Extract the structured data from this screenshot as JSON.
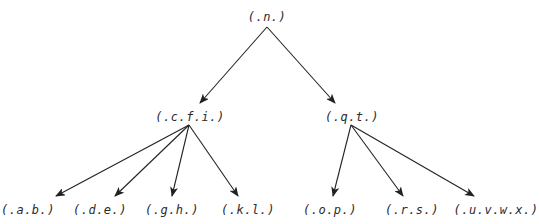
{
  "diagram": {
    "type": "tree",
    "colors": {
      "edge": "#222222",
      "text": "#2a2a2a",
      "background": "#ffffff"
    },
    "nodes": [
      {
        "id": "n",
        "label": "(.n.)",
        "x": 267,
        "y": 17,
        "ax": 267,
        "ay": 27,
        "tx": 267,
        "ty": 10
      },
      {
        "id": "cfi",
        "label": "(.c.f.i.)",
        "x": 190,
        "y": 117,
        "ax": 189,
        "ay": 125,
        "tx": 200,
        "ty": 103
      },
      {
        "id": "qt",
        "label": "(.q.t.)",
        "x": 352,
        "y": 117,
        "ax": 351,
        "ay": 125,
        "tx": 335,
        "ty": 103
      },
      {
        "id": "ab",
        "label": "(.a.b.)",
        "x": 28,
        "y": 210,
        "tx": 56,
        "ty": 196
      },
      {
        "id": "de",
        "label": "(.d.e.)",
        "x": 100,
        "y": 210,
        "tx": 115,
        "ty": 196
      },
      {
        "id": "gh",
        "label": "(.g.h.)",
        "x": 172,
        "y": 210,
        "tx": 172,
        "ty": 196
      },
      {
        "id": "kl",
        "label": "(.k.l.)",
        "x": 248,
        "y": 210,
        "tx": 238,
        "ty": 196
      },
      {
        "id": "op",
        "label": "(.o.p.)",
        "x": 330,
        "y": 210,
        "tx": 333,
        "ty": 196
      },
      {
        "id": "rs",
        "label": "(.r.s.)",
        "x": 412,
        "y": 210,
        "tx": 403,
        "ty": 196
      },
      {
        "id": "uvwx",
        "label": "(.u.v.w.x.)",
        "x": 496,
        "y": 210,
        "tx": 474,
        "ty": 196
      }
    ],
    "edges": [
      {
        "from": "n",
        "to": "cfi"
      },
      {
        "from": "n",
        "to": "qt"
      },
      {
        "from": "cfi",
        "to": "ab"
      },
      {
        "from": "cfi",
        "to": "de"
      },
      {
        "from": "cfi",
        "to": "gh"
      },
      {
        "from": "cfi",
        "to": "kl"
      },
      {
        "from": "qt",
        "to": "op"
      },
      {
        "from": "qt",
        "to": "rs"
      },
      {
        "from": "qt",
        "to": "uvwx"
      }
    ]
  }
}
